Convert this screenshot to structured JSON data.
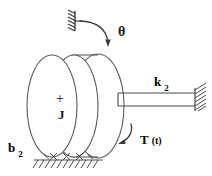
{
  "figure": {
    "type": "rotational-mechanical-system-schematic",
    "background_color": "#ffffff",
    "line_color": "#333333",
    "text_color": "#1a1a1a"
  },
  "labels": {
    "theta": "θ",
    "inertia": "J",
    "center_mark": "+",
    "spring_symbol": "k",
    "spring_subscript": "2",
    "damper_symbol": "b",
    "damper_subscript": "2",
    "torque_symbol": "T",
    "torque_argument": "(t)"
  },
  "components": {
    "disk": {
      "name": "rotational-inertia-disk",
      "label": "J",
      "center_mark": "+"
    },
    "top_support": {
      "name": "fixed-support-top",
      "hatched": true
    },
    "right_wall": {
      "name": "fixed-wall-right",
      "hatched": true
    },
    "spring_shaft": {
      "name": "torsional-spring-k2",
      "label": "k",
      "subscript": "2"
    },
    "ground": {
      "name": "ground-support-rollers",
      "label": "b",
      "subscript": "2",
      "roller_count": 3
    },
    "theta_arrow": {
      "name": "rotation-arrow-theta",
      "label": "θ"
    },
    "torque_arrow": {
      "name": "torque-arrow",
      "label": "T (t)"
    }
  }
}
